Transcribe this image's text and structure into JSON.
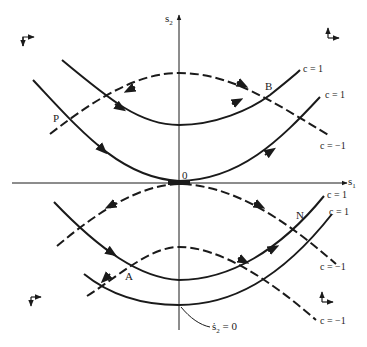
{
  "axes": {
    "x_label": "s",
    "x_sub": "1",
    "y_label": "s",
    "y_sub": "2"
  },
  "points": {
    "origin": "0",
    "P": "P",
    "B": "B",
    "N": "N",
    "A": "A"
  },
  "curve_labels": {
    "upper_c1_a": "c = 1",
    "upper_c1_b": "c = 1",
    "upper_cm1": "c = −1",
    "lower_c1_a": "c = 1",
    "lower_c1_b": "c = 1",
    "lower_cm1_a": "c = −1",
    "lower_cm1_b": "c = −1"
  },
  "annotation": {
    "s2dot_label": "ṡ",
    "s2dot_sub": "2",
    "s2dot_eq": " = 0"
  },
  "quadrant_icons": [
    {
      "name": "switching-direction-right-down-icon",
      "position": "top-left"
    },
    {
      "name": "switching-direction-up-right-icon",
      "position": "top-right"
    },
    {
      "name": "switching-direction-right-down-icon",
      "position": "bottom-left"
    },
    {
      "name": "switching-direction-up-right-icon",
      "position": "bottom-right"
    }
  ],
  "colors": {
    "line": "#1a1a1a",
    "background": "#ffffff"
  }
}
